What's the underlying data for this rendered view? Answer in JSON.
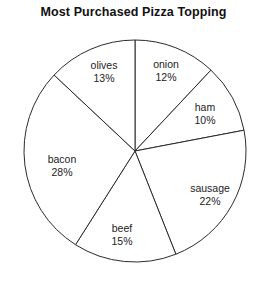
{
  "chart_data": {
    "type": "pie",
    "title": "Most Purchased Pizza Topping",
    "xlabel": "",
    "ylabel": "",
    "units": "percent",
    "total": 100,
    "start_angle_deg": 0,
    "direction": "clockwise",
    "legend": "none",
    "grid": false,
    "categories": [
      "onion",
      "ham",
      "sausage",
      "beef",
      "bacon",
      "olives"
    ],
    "values": [
      12,
      10,
      22,
      15,
      28,
      13
    ],
    "slices": [
      {
        "label": "onion",
        "value": 12,
        "value_text": "12%",
        "label_x": 166,
        "label_y": 71
      },
      {
        "label": "ham",
        "value": 10,
        "value_text": "10%",
        "label_x": 205,
        "label_y": 114
      },
      {
        "label": "sausage",
        "value": 22,
        "value_text": "22%",
        "label_x": 210,
        "label_y": 195
      },
      {
        "label": "beef",
        "value": 15,
        "value_text": "15%",
        "label_x": 122,
        "label_y": 235
      },
      {
        "label": "bacon",
        "value": 28,
        "value_text": "28%",
        "label_x": 62,
        "label_y": 166
      },
      {
        "label": "olives",
        "value": 13,
        "value_text": "13%",
        "label_x": 104,
        "label_y": 72
      }
    ],
    "geometry": {
      "center_x": 135,
      "center_y": 151,
      "radius": 111
    },
    "colors": {
      "slice_fill": "#ffffff",
      "slice_stroke": "#2b2b2b",
      "text": "#222222",
      "title": "#111111",
      "background": "#ffffff"
    }
  }
}
